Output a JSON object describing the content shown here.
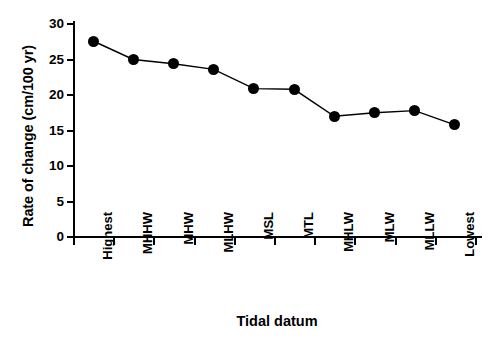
{
  "chart_data": {
    "type": "line",
    "title": "",
    "xlabel": "Tidal datum",
    "ylabel": "Rate of change (cm/100 yr)",
    "categories": [
      "Highest",
      "MHHW",
      "MHW",
      "MLHW",
      "MSL",
      "MTL",
      "MHLW",
      "MLW",
      "MLLW",
      "Lowest"
    ],
    "values": [
      27.6,
      25.0,
      24.4,
      23.6,
      20.9,
      20.8,
      17.0,
      17.5,
      17.8,
      15.8
    ],
    "ylim": [
      0,
      30
    ],
    "yticks": [
      0,
      5,
      10,
      15,
      20,
      25,
      30
    ],
    "ytick_labels": [
      "0",
      "5",
      "10",
      "15",
      "20",
      "25",
      "30"
    ],
    "grid": false,
    "legend": null,
    "marker": "filled-circle",
    "marker_color": "#000000",
    "line_color": "#000000"
  },
  "axes": {
    "y_title": "Rate of change (cm/100 yr)",
    "x_title": "Tidal datum"
  }
}
